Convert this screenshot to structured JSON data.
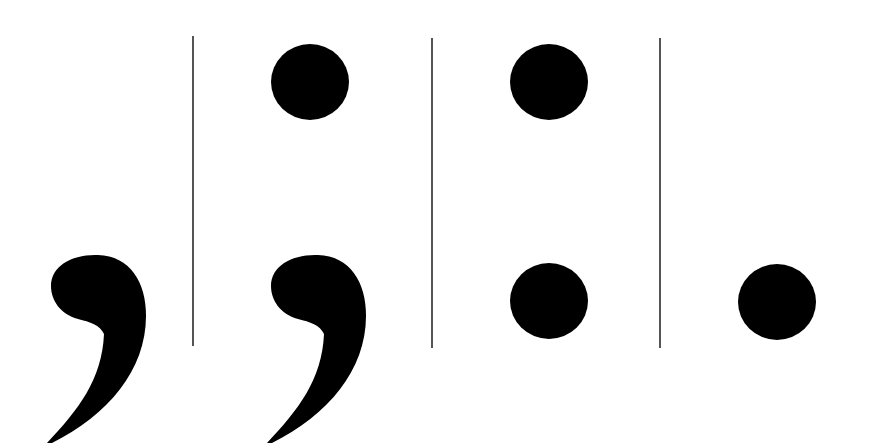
{
  "figure": {
    "marks": [
      {
        "name": "comma",
        "glyph": ","
      },
      {
        "name": "semicolon",
        "glyph": ";"
      },
      {
        "name": "colon",
        "glyph": ":"
      },
      {
        "name": "period",
        "glyph": "."
      }
    ],
    "separator_count": 3,
    "colors": {
      "background": "#ffffff",
      "mark": "#000000",
      "separator": "#555555"
    }
  }
}
